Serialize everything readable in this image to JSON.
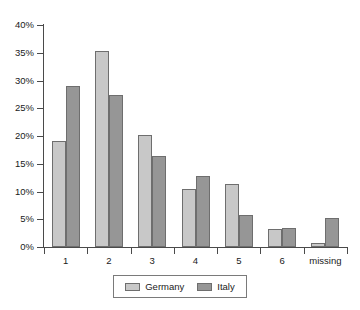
{
  "chart_data": {
    "type": "bar",
    "title": "",
    "subtitle": "",
    "xlabel": "",
    "ylabel": "",
    "categories": [
      "1",
      "2",
      "3",
      "4",
      "5",
      "6",
      "missing"
    ],
    "series": [
      {
        "name": "Germany",
        "color": "#c8c8c8",
        "values": [
          19.1,
          35.4,
          20.1,
          10.4,
          11.3,
          3.3,
          0.7
        ]
      },
      {
        "name": "Italy",
        "color": "#969696",
        "values": [
          29.0,
          27.4,
          16.4,
          12.8,
          5.7,
          3.5,
          5.3
        ]
      }
    ],
    "ylim": [
      0,
      40
    ],
    "ytick_values": [
      0,
      5,
      10,
      15,
      20,
      25,
      30,
      35,
      40
    ],
    "ytick_labels": [
      "0%",
      "5%",
      "10%",
      "15%",
      "20%",
      "25%",
      "30%",
      "35%",
      "40%"
    ],
    "grid": false,
    "legend_position": "bottom",
    "value_unit": "%"
  },
  "legend": {
    "entries": [
      {
        "label": "Germany"
      },
      {
        "label": "Italy"
      }
    ]
  }
}
